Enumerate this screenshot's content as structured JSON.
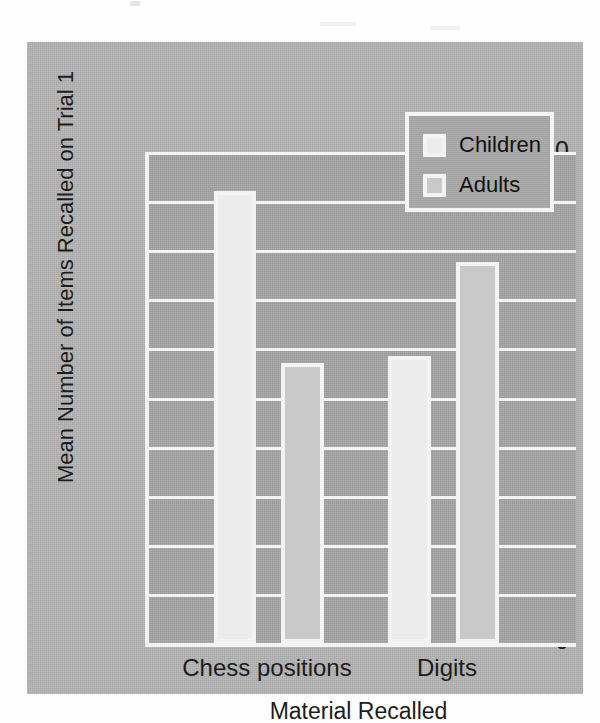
{
  "chart_data": {
    "type": "bar",
    "title": "",
    "xlabel": "Material Recalled",
    "ylabel": "Mean Number of Items Recalled on Trial 1",
    "categories": [
      "Chess positions",
      "Digits"
    ],
    "series": [
      {
        "name": "Children",
        "values": [
          9.2,
          5.85
        ],
        "color": "#ececec"
      },
      {
        "name": "Adults",
        "values": [
          5.7,
          7.75
        ],
        "color": "#c9c9c9"
      }
    ],
    "ylim": [
      0,
      10
    ],
    "ytick_labels": [
      "10",
      "9",
      "8",
      "7",
      "6",
      "5",
      "4",
      "3",
      "2",
      "1",
      "0"
    ],
    "ytick_values": [
      10,
      9,
      8,
      7,
      6,
      5,
      4,
      3,
      2,
      1,
      0
    ],
    "grid": true,
    "legend_position": "top-right",
    "legend_entries": [
      "Children",
      "Adults"
    ],
    "bars": [
      {
        "series": "Children",
        "category": "Chess positions",
        "value": 9.2
      },
      {
        "series": "Adults",
        "category": "Chess positions",
        "value": 5.7
      },
      {
        "series": "Children",
        "category": "Digits",
        "value": 5.85
      },
      {
        "series": "Adults",
        "category": "Digits",
        "value": 7.75
      }
    ]
  },
  "colors": {
    "page_background": "#fefefe",
    "figure_panel": "#b4b4b4",
    "plot_background": "#a6a6a6",
    "gridline": "#f4f4f4",
    "axis_line": "#f2f2f2",
    "bar_outline": "#f3f3f3",
    "children_fill": "#ececec",
    "adults_fill": "#c9c9c9",
    "text": "#1c1c1c"
  }
}
